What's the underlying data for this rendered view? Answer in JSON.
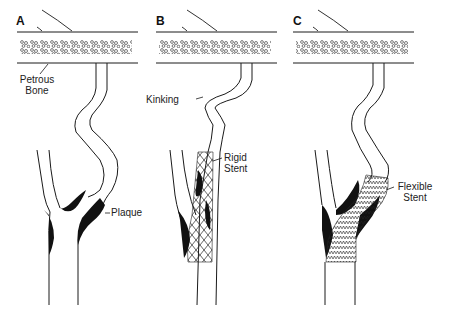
{
  "figure": {
    "panels": [
      {
        "letter": "A",
        "labels": {
          "bone": "Petrous\nBone",
          "bone_line1": "Petrous",
          "bone_line2": "Bone",
          "plaque": "Plaque"
        }
      },
      {
        "letter": "B",
        "labels": {
          "kinking": "Kinking",
          "stent_line1": "Rigid",
          "stent_line2": "Stent"
        }
      },
      {
        "letter": "C",
        "labels": {
          "stent_line1": "Flexible",
          "stent_line2": "Stent"
        }
      }
    ],
    "colors": {
      "line": "#1a1a1a",
      "plaque": "#111111",
      "background": "#ffffff"
    }
  }
}
